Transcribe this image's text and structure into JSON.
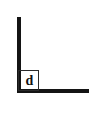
{
  "diagram": {
    "type": "right-angle-corner",
    "background_color": "#ffffff",
    "stroke_color": "#141414",
    "box_stroke_color": "#2a2a2a",
    "label_color": "#111111",
    "corner_label": "d",
    "legs": [
      {
        "name": "vertical-leg",
        "orientation": "vertical",
        "x": 17,
        "y_start": 17,
        "y_end": 93,
        "thickness": 4
      },
      {
        "name": "horizontal-leg",
        "orientation": "horizontal",
        "y": 89,
        "x_start": 17,
        "x_end": 89,
        "thickness": 4
      }
    ],
    "corner_square": {
      "x": 18,
      "y": 70,
      "size": 21,
      "border_width": 1
    }
  }
}
